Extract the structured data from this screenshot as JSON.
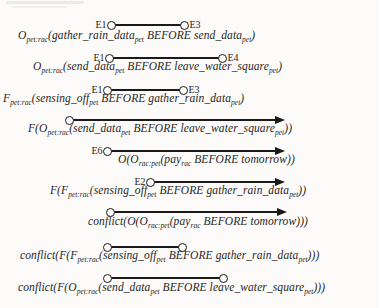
{
  "colors": {
    "paper": "#fcfbfa",
    "ink": "#1f1f1f"
  },
  "rows": [
    {
      "formula": "O_{pet:rac}(gather_rain_data_{pet} BEFORE send_data_{pet})",
      "marker": {
        "type": "segment",
        "start_label": "E1",
        "end_label": "E3"
      }
    },
    {
      "formula": "O_{pet:rac}(send_data_{pet} BEFORE leave_water_square_{pet})",
      "marker": {
        "type": "segment",
        "start_label": "E1",
        "end_label": "E4"
      }
    },
    {
      "formula": "F_{pet:rac}(sensing_off_{pet} BEFORE gather_rain_data_{pet})",
      "marker": {
        "type": "segment",
        "start_label": "E1",
        "end_label": "E3"
      }
    },
    {
      "formula": "F(O_{pet:rac}(send_data_{pet} BEFORE leave_water_square_{pet}))",
      "marker": {
        "type": "ray",
        "start_label": "",
        "end_label": ""
      }
    },
    {
      "formula": "O(O_{rac:pet}(pay_{rac} BEFORE tomorrow))",
      "marker": {
        "type": "ray",
        "start_label": "E6",
        "end_label": ""
      }
    },
    {
      "formula": "F(F_{pet:rac}(sensing_off_{pet} BEFORE gather_rain_data_{pet}))",
      "marker": {
        "type": "ray",
        "start_label": "E2",
        "end_label": ""
      }
    },
    {
      "formula": "conflict(O(O_{rac:pet}(pay_{rac} BEFORE tomorrow)))",
      "marker": {
        "type": "ray",
        "start_label": "",
        "end_label": ""
      }
    },
    {
      "formula": "conflict(F(F_{pet:rac}(sensing_off_{pet} BEFORE gather_rain_data_{pet})))",
      "marker": {
        "type": "segment",
        "start_label": "",
        "end_label": ""
      }
    },
    {
      "formula": "conflict(F(O_{pet:rac}(send_data_{pet} BEFORE leave_water_square_{pet})))",
      "marker": {
        "type": "segment",
        "start_label": "",
        "end_label": ""
      }
    }
  ]
}
